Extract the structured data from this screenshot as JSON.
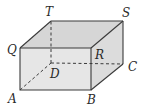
{
  "diagram": {
    "type": "rectangular-prism",
    "colors": {
      "front_face": "#e4e4e4",
      "top_face": "#d8d8d8",
      "side_face": "#dedede",
      "edge": "#3a3a3a"
    },
    "vertices": {
      "A": {
        "label": "A",
        "x": 20,
        "y": 90,
        "lx": 8,
        "ly": 103
      },
      "B": {
        "label": "B",
        "x": 91,
        "y": 90,
        "lx": 87,
        "ly": 104
      },
      "C": {
        "label": "C",
        "x": 123,
        "y": 64,
        "lx": 128,
        "ly": 71
      },
      "D": {
        "label": "D",
        "x": 51,
        "y": 63,
        "lx": 50,
        "ly": 78
      },
      "Q": {
        "label": "Q",
        "x": 20,
        "y": 48,
        "lx": 7,
        "ly": 54
      },
      "R": {
        "label": "R",
        "x": 91,
        "y": 48,
        "lx": 95,
        "ly": 59
      },
      "S": {
        "label": "S",
        "x": 123,
        "y": 21,
        "lx": 122,
        "ly": 18
      },
      "T": {
        "label": "T",
        "x": 51,
        "y": 21,
        "lx": 45,
        "ly": 16
      }
    },
    "hidden_edges": [
      "A-D",
      "D-C",
      "D-T"
    ]
  }
}
